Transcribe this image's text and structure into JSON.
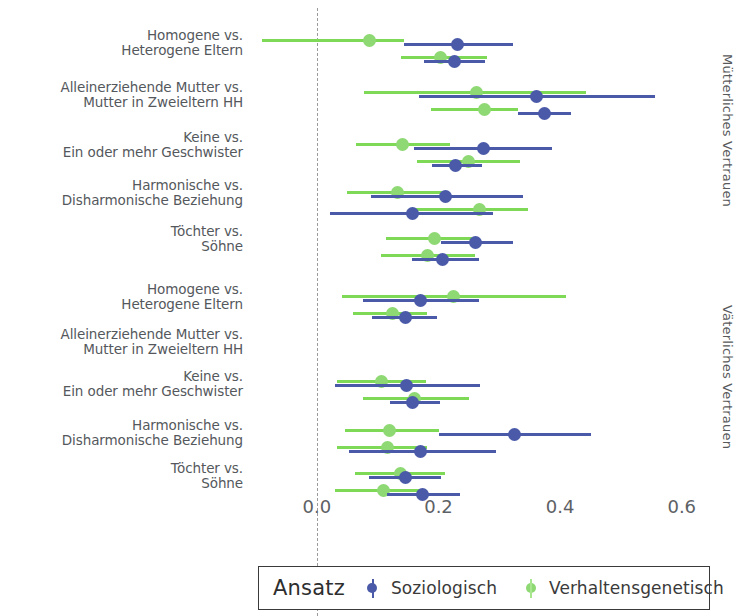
{
  "legend": {
    "title": "Ansatz",
    "items": [
      {
        "label": "Soziologisch",
        "color": "#4a5aa8",
        "key": "soziologisch"
      },
      {
        "label": "Verhaltensgenetisch",
        "color": "#8ed973",
        "key": "verhaltensgenetisch"
      }
    ]
  },
  "facets": [
    {
      "label": "Mütterliches Vertrauen"
    },
    {
      "label": "Väterliches Vertrauen"
    }
  ],
  "axis": {
    "ticks": [
      "0.0",
      "0.2",
      "0.4",
      "0.6"
    ],
    "tick_values": [
      0.0,
      0.2,
      0.4,
      0.6
    ],
    "min": -0.11,
    "max": 0.63,
    "zero_reference": 0.0
  },
  "row_labels": [
    "Homogene vs.\nHeterogene Eltern",
    "Alleinerziehende Mutter vs.\nMutter in Zweieltern HH",
    "Keine vs.\nEin oder mehr Geschwister",
    "Harmonische vs.\nDisharmonische Beziehung",
    "Töchter vs.\nSöhne"
  ],
  "chart_data": {
    "type": "scatter",
    "subtype": "forest-plot",
    "title": "",
    "xlabel": "",
    "ylabel": "",
    "xlim": [
      -0.11,
      0.63
    ],
    "xticks": [
      0.0,
      0.2,
      0.4,
      0.6
    ],
    "grid": false,
    "legend_position": "bottom",
    "legend_title": "Ansatz",
    "series": [
      {
        "name": "Soziologisch",
        "color": "#4a5aa8"
      },
      {
        "name": "Verhaltensgenetisch",
        "color": "#8ed973"
      }
    ],
    "panels": [
      {
        "facet": "Mütterliches Vertrauen",
        "rows": [
          {
            "category": "Homogene vs.\nHeterogene Eltern",
            "estimates": [
              {
                "series": "Verhaltensgenetisch",
                "sub": 0,
                "estimate": 0.087,
                "ci_low": -0.09,
                "ci_high": 0.144
              },
              {
                "series": "Soziologisch",
                "sub": 0,
                "estimate": 0.231,
                "ci_low": 0.144,
                "ci_high": 0.323
              },
              {
                "series": "Verhaltensgenetisch",
                "sub": 1,
                "estimate": 0.203,
                "ci_low": 0.139,
                "ci_high": 0.279
              },
              {
                "series": "Soziologisch",
                "sub": 1,
                "estimate": 0.227,
                "ci_low": 0.176,
                "ci_high": 0.276
              }
            ]
          },
          {
            "category": "Alleinerziehende Mutter vs.\nMutter in Zweieltern HH",
            "estimates": [
              {
                "series": "Verhaltensgenetisch",
                "sub": 0,
                "estimate": 0.263,
                "ci_low": 0.078,
                "ci_high": 0.442
              },
              {
                "series": "Soziologisch",
                "sub": 0,
                "estimate": 0.361,
                "ci_low": 0.168,
                "ci_high": 0.556
              },
              {
                "series": "Verhaltensgenetisch",
                "sub": 1,
                "estimate": 0.276,
                "ci_low": 0.187,
                "ci_high": 0.33
              },
              {
                "series": "Soziologisch",
                "sub": 1,
                "estimate": 0.374,
                "ci_low": 0.331,
                "ci_high": 0.418
              }
            ]
          },
          {
            "category": "Keine vs.\nEin oder mehr Geschwister",
            "estimates": [
              {
                "series": "Verhaltensgenetisch",
                "sub": 0,
                "estimate": 0.141,
                "ci_low": 0.065,
                "ci_high": 0.219
              },
              {
                "series": "Soziologisch",
                "sub": 0,
                "estimate": 0.274,
                "ci_low": 0.16,
                "ci_high": 0.387
              },
              {
                "series": "Verhaltensgenetisch",
                "sub": 1,
                "estimate": 0.25,
                "ci_low": 0.165,
                "ci_high": 0.334
              },
              {
                "series": "Soziologisch",
                "sub": 1,
                "estimate": 0.228,
                "ci_low": 0.189,
                "ci_high": 0.271
              }
            ]
          },
          {
            "category": "Harmonische vs.\nDisharmonische Beziehung",
            "estimates": [
              {
                "series": "Verhaltensgenetisch",
                "sub": 0,
                "estimate": 0.132,
                "ci_low": 0.049,
                "ci_high": 0.208
              },
              {
                "series": "Soziologisch",
                "sub": 0,
                "estimate": 0.211,
                "ci_low": 0.089,
                "ci_high": 0.339
              },
              {
                "series": "Verhaltensgenetisch",
                "sub": 1,
                "estimate": 0.268,
                "ci_low": 0.157,
                "ci_high": 0.347
              },
              {
                "series": "Soziologisch",
                "sub": 1,
                "estimate": 0.157,
                "ci_low": 0.022,
                "ci_high": 0.29
              }
            ]
          },
          {
            "category": "Töchter vs.\nSöhne",
            "estimates": [
              {
                "series": "Verhaltensgenetisch",
                "sub": 0,
                "estimate": 0.193,
                "ci_low": 0.113,
                "ci_high": 0.255
              },
              {
                "series": "Soziologisch",
                "sub": 0,
                "estimate": 0.261,
                "ci_low": 0.204,
                "ci_high": 0.323
              },
              {
                "series": "Verhaltensgenetisch",
                "sub": 1,
                "estimate": 0.182,
                "ci_low": 0.105,
                "ci_high": 0.26
              },
              {
                "series": "Soziologisch",
                "sub": 1,
                "estimate": 0.206,
                "ci_low": 0.157,
                "ci_high": 0.266
              }
            ]
          }
        ]
      },
      {
        "facet": "Väterliches Vertrauen",
        "rows": [
          {
            "category": "Homogene vs.\nHeterogene Eltern",
            "estimates": [
              {
                "series": "Verhaltensgenetisch",
                "sub": 0,
                "estimate": 0.225,
                "ci_low": 0.041,
                "ci_high": 0.409
              },
              {
                "series": "Soziologisch",
                "sub": 0,
                "estimate": 0.171,
                "ci_low": 0.076,
                "ci_high": 0.266
              },
              {
                "series": "Verhaltensgenetisch",
                "sub": 1,
                "estimate": 0.124,
                "ci_low": 0.06,
                "ci_high": 0.181
              },
              {
                "series": "Soziologisch",
                "sub": 1,
                "estimate": 0.146,
                "ci_low": 0.09,
                "ci_high": 0.198
              }
            ]
          },
          {
            "category": "Alleinerziehende Mutter vs.\nMutter in Zweieltern HH",
            "estimates": []
          },
          {
            "category": "Keine vs.\nEin oder mehr Geschwister",
            "estimates": [
              {
                "series": "Verhaltensgenetisch",
                "sub": 0,
                "estimate": 0.106,
                "ci_low": 0.033,
                "ci_high": 0.179
              },
              {
                "series": "Soziologisch",
                "sub": 0,
                "estimate": 0.147,
                "ci_low": 0.03,
                "ci_high": 0.268
              },
              {
                "series": "Verhaltensgenetisch",
                "sub": 1,
                "estimate": 0.16,
                "ci_low": 0.076,
                "ci_high": 0.25
              },
              {
                "series": "Soziologisch",
                "sub": 1,
                "estimate": 0.158,
                "ci_low": 0.12,
                "ci_high": 0.203
              }
            ]
          },
          {
            "category": "Harmonische vs.\nDisharmonische Beziehung",
            "estimates": [
              {
                "series": "Verhaltensgenetisch",
                "sub": 0,
                "estimate": 0.12,
                "ci_low": 0.046,
                "ci_high": 0.2
              },
              {
                "series": "Soziologisch",
                "sub": 0,
                "estimate": 0.325,
                "ci_low": 0.2,
                "ci_high": 0.45
              },
              {
                "series": "Verhaltensgenetisch",
                "sub": 1,
                "estimate": 0.116,
                "ci_low": 0.033,
                "ci_high": 0.181
              },
              {
                "series": "Soziologisch",
                "sub": 1,
                "estimate": 0.171,
                "ci_low": 0.052,
                "ci_high": 0.295
              }
            ]
          },
          {
            "category": "Töchter vs.\nSöhne",
            "estimates": [
              {
                "series": "Verhaltensgenetisch",
                "sub": 0,
                "estimate": 0.138,
                "ci_low": 0.062,
                "ci_high": 0.211
              },
              {
                "series": "Soziologisch",
                "sub": 0,
                "estimate": 0.146,
                "ci_low": 0.086,
                "ci_high": 0.204
              },
              {
                "series": "Verhaltensgenetisch",
                "sub": 1,
                "estimate": 0.109,
                "ci_low": 0.03,
                "ci_high": 0.179
              },
              {
                "series": "Soziologisch",
                "sub": 1,
                "estimate": 0.173,
                "ci_low": 0.116,
                "ci_high": 0.235
              }
            ]
          }
        ]
      }
    ]
  }
}
